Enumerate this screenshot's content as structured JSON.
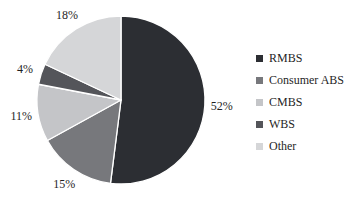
{
  "chart_data": {
    "type": "pie",
    "categories": [
      "RMBS",
      "Consumer ABS",
      "CMBS",
      "WBS",
      "Other"
    ],
    "values": [
      52,
      15,
      11,
      4,
      18
    ],
    "data_labels": [
      "52%",
      "15%",
      "11%",
      "4%",
      "18%"
    ],
    "unit": "%",
    "colors": [
      "#2c2e33",
      "#77787c",
      "#c4c5c8",
      "#54555a",
      "#d5d6d8"
    ],
    "slice_border_color": "#ffffff",
    "label_text_color": "#1f1f1f",
    "title": "",
    "legend_position": "right",
    "start_angle_deg": 0,
    "direction": "clockwise"
  }
}
